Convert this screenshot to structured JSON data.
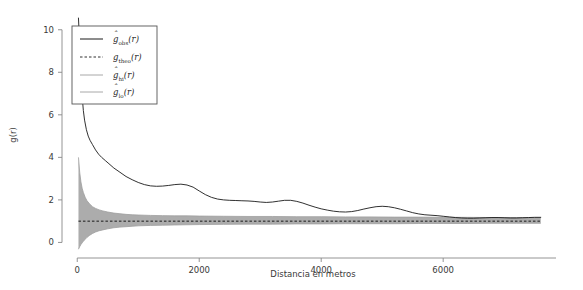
{
  "chart_data": {
    "type": "line",
    "title": "",
    "xlabel": "Distancia en metros",
    "ylabel": "g(r)",
    "xlim": [
      -250,
      7850
    ],
    "ylim": [
      -0.45,
      10.6
    ],
    "xticks": [
      0,
      2000,
      4000,
      6000
    ],
    "xtick_labels": [
      "0",
      "2000",
      "4000",
      "6000"
    ],
    "yticks": [
      0,
      2,
      4,
      6,
      8,
      10
    ],
    "ytick_labels": [
      "0",
      "2",
      "4",
      "6",
      "8",
      "10"
    ],
    "grid": false,
    "legend_position": "top-left",
    "legend": [
      {
        "key": "obs",
        "symbol": "g",
        "hat": true,
        "sub": "obs",
        "arg": "(r)",
        "style": "solid",
        "color": "#1a1a1a"
      },
      {
        "key": "theo",
        "symbol": "g",
        "hat": false,
        "sub": "theo",
        "arg": "(r)",
        "style": "dashed",
        "color": "#1a1a1a"
      },
      {
        "key": "hi",
        "symbol": "g",
        "hat": true,
        "sub": "hi",
        "arg": "(r)",
        "style": "solid",
        "color": "#9e9e9e"
      },
      {
        "key": "lo",
        "symbol": "g",
        "hat": true,
        "sub": "lo",
        "arg": "(r)",
        "style": "solid",
        "color": "#9e9e9e"
      }
    ],
    "envelope_fill_color": "#a8a8a8",
    "series": [
      {
        "name": "g_obs(r)",
        "style": "solid",
        "color": "#1a1a1a",
        "x": [
          20,
          40,
          60,
          80,
          100,
          120,
          150,
          180,
          210,
          250,
          300,
          350,
          400,
          460,
          520,
          600,
          700,
          800,
          900,
          1000,
          1100,
          1200,
          1300,
          1400,
          1500,
          1600,
          1700,
          1800,
          1900,
          2000,
          2100,
          2200,
          2300,
          2400,
          2500,
          2600,
          2700,
          2800,
          2900,
          3000,
          3100,
          3200,
          3300,
          3400,
          3500,
          3600,
          3700,
          3800,
          3900,
          4000,
          4100,
          4200,
          4300,
          4400,
          4500,
          4600,
          4700,
          4800,
          4900,
          5000,
          5100,
          5200,
          5300,
          5400,
          5500,
          5600,
          5700,
          5800,
          5900,
          6000,
          6100,
          6200,
          6300,
          6400,
          6500,
          6600,
          6700,
          6800,
          6900,
          7000,
          7100,
          7200,
          7300,
          7400,
          7500,
          7600
        ],
        "y": [
          10.55,
          9.3,
          7.9,
          6.9,
          6.2,
          5.75,
          5.3,
          5.0,
          4.8,
          4.6,
          4.35,
          4.15,
          4.0,
          3.85,
          3.7,
          3.5,
          3.3,
          3.1,
          2.95,
          2.82,
          2.72,
          2.66,
          2.64,
          2.65,
          2.68,
          2.72,
          2.74,
          2.7,
          2.6,
          2.42,
          2.25,
          2.12,
          2.04,
          2.0,
          1.98,
          1.97,
          1.96,
          1.95,
          1.93,
          1.9,
          1.88,
          1.9,
          1.94,
          1.98,
          1.98,
          1.93,
          1.85,
          1.75,
          1.66,
          1.58,
          1.52,
          1.47,
          1.44,
          1.43,
          1.45,
          1.5,
          1.57,
          1.63,
          1.68,
          1.7,
          1.68,
          1.63,
          1.56,
          1.48,
          1.4,
          1.34,
          1.3,
          1.28,
          1.26,
          1.23,
          1.2,
          1.17,
          1.15,
          1.14,
          1.14,
          1.15,
          1.16,
          1.17,
          1.17,
          1.16,
          1.15,
          1.15,
          1.16,
          1.17,
          1.18,
          1.18
        ]
      },
      {
        "name": "g_theo(r)",
        "style": "dashed",
        "color": "#1a1a1a",
        "constant_y": 1.0
      },
      {
        "name": "g_hi(r)",
        "style": "solid",
        "color": "#9e9e9e",
        "x": [
          20,
          40,
          60,
          80,
          100,
          130,
          160,
          200,
          250,
          300,
          360,
          420,
          500,
          600,
          700,
          800,
          900,
          1000,
          1200,
          1400,
          1600,
          1800,
          2000,
          2400,
          2800,
          3200,
          3600,
          4000,
          4400,
          4800,
          5200,
          5600,
          6000,
          6400,
          6800,
          7200,
          7600
        ],
        "y": [
          4.0,
          3.3,
          2.85,
          2.55,
          2.35,
          2.12,
          1.96,
          1.82,
          1.68,
          1.6,
          1.53,
          1.48,
          1.43,
          1.38,
          1.35,
          1.32,
          1.3,
          1.29,
          1.27,
          1.26,
          1.25,
          1.25,
          1.24,
          1.23,
          1.22,
          1.22,
          1.21,
          1.21,
          1.2,
          1.2,
          1.19,
          1.19,
          1.18,
          1.18,
          1.17,
          1.17,
          1.16
        ]
      },
      {
        "name": "g_lo(r)",
        "style": "solid",
        "color": "#9e9e9e",
        "x": [
          20,
          40,
          60,
          80,
          100,
          130,
          160,
          200,
          250,
          300,
          360,
          420,
          500,
          600,
          700,
          800,
          900,
          1000,
          1200,
          1400,
          1600,
          1800,
          2000,
          2400,
          2800,
          3200,
          3600,
          4000,
          4400,
          4800,
          5200,
          5600,
          6000,
          6400,
          6800,
          7200,
          7600
        ],
        "y": [
          -0.32,
          -0.2,
          -0.1,
          -0.02,
          0.05,
          0.15,
          0.24,
          0.33,
          0.42,
          0.49,
          0.55,
          0.59,
          0.64,
          0.69,
          0.72,
          0.74,
          0.76,
          0.78,
          0.8,
          0.81,
          0.82,
          0.83,
          0.84,
          0.85,
          0.86,
          0.86,
          0.87,
          0.87,
          0.88,
          0.88,
          0.88,
          0.89,
          0.89,
          0.89,
          0.9,
          0.9,
          0.9
        ]
      }
    ]
  }
}
